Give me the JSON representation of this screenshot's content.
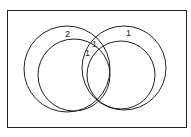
{
  "diagram": {
    "type": "venn",
    "frame": {
      "x": 7,
      "y": 10,
      "w": 179,
      "h": 117
    },
    "stroke_color": "#222222",
    "circles": [
      {
        "name": "left-outer-circle",
        "cx": 67,
        "cy": 69,
        "r": 43
      },
      {
        "name": "left-inner-circle",
        "cx": 74,
        "cy": 75,
        "r": 36
      },
      {
        "name": "right-outer-circle",
        "cx": 124,
        "cy": 68,
        "r": 42
      },
      {
        "name": "right-inner-circle",
        "cx": 121,
        "cy": 75,
        "r": 34
      }
    ],
    "labels": [
      {
        "name": "label-left-ring",
        "text": "2",
        "x": 65,
        "y": 37
      },
      {
        "name": "label-right-ring",
        "text": "1",
        "x": 126,
        "y": 36
      },
      {
        "name": "label-intersection-upper",
        "text": "1",
        "x": 92,
        "y": 47
      },
      {
        "name": "label-intersection-lower",
        "text": "1",
        "x": 85,
        "y": 56
      }
    ]
  }
}
